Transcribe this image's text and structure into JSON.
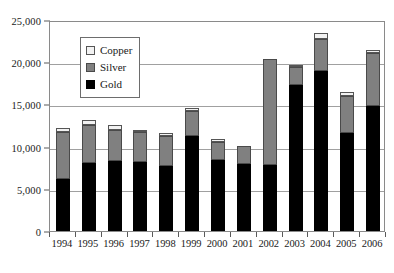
{
  "chart_data": {
    "type": "bar",
    "stacked": true,
    "title": "",
    "subtitle": "",
    "xlabel": "",
    "ylabel": "",
    "categories": [
      "1994",
      "1995",
      "1996",
      "1997",
      "1998",
      "1999",
      "2000",
      "2001",
      "2002",
      "2003",
      "2004",
      "2005",
      "2006"
    ],
    "series": [
      {
        "name": "Gold",
        "color": "#000000",
        "values": [
          6200,
          8000,
          8300,
          8200,
          7700,
          11300,
          8400,
          7900,
          7800,
          17300,
          18900,
          11600,
          14800
        ]
      },
      {
        "name": "Silver",
        "color": "#808080",
        "values": [
          5500,
          4600,
          3700,
          3500,
          3500,
          2900,
          2200,
          2200,
          12600,
          2100,
          3800,
          4400,
          6300
        ]
      },
      {
        "name": "Copper",
        "color": "#f2f2f2",
        "values": [
          500,
          500,
          600,
          300,
          400,
          400,
          300,
          0,
          0,
          200,
          800,
          500,
          400
        ]
      }
    ],
    "stack_order_bottom_to_top": [
      "Gold",
      "Silver",
      "Copper"
    ],
    "totals": [
      12200,
      13100,
      12600,
      12000,
      11600,
      14600,
      10900,
      10100,
      20400,
      19600,
      23500,
      16500,
      21500
    ],
    "ylim": [
      0,
      25000
    ],
    "yticks": [
      0,
      5000,
      10000,
      15000,
      20000,
      25000
    ],
    "ytick_labels": [
      "0",
      "5,000",
      "10,000",
      "15,000",
      "20,000",
      "25,000"
    ],
    "grid": true,
    "grid_axis": "y",
    "legend_position": "upper-left-inside",
    "legend_entries": [
      {
        "label": "Copper",
        "swatch": "copper"
      },
      {
        "label": "Silver",
        "swatch": "silver"
      },
      {
        "label": "Gold",
        "swatch": "gold"
      }
    ]
  }
}
